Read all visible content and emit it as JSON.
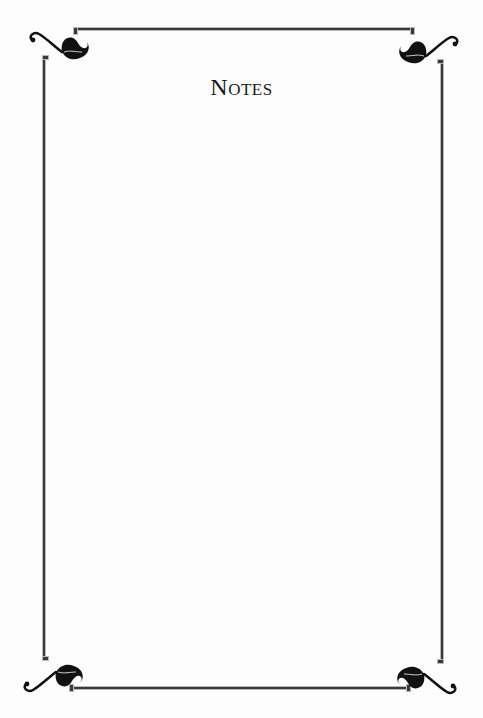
{
  "page": {
    "title": "Notes",
    "style": {
      "ink_color": "#1a1a1a",
      "rule_color": "#3a3a3a",
      "rule_highlight": "#b9b9b9",
      "background": "#fdfdfd"
    },
    "ornaments": [
      {
        "position": "top-left",
        "icon": "leaf-flourish-icon"
      },
      {
        "position": "top-right",
        "icon": "leaf-flourish-icon"
      },
      {
        "position": "bottom-left",
        "icon": "leaf-flourish-icon"
      },
      {
        "position": "bottom-right",
        "icon": "leaf-flourish-icon"
      }
    ]
  }
}
